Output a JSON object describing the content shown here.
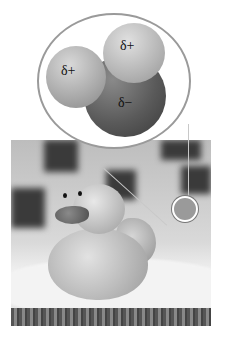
{
  "figure": {
    "top_caption_fragment": "",
    "inset": {
      "type": "water-molecule",
      "atoms": [
        {
          "element": "H",
          "charge_label": "δ+"
        },
        {
          "element": "H",
          "charge_label": "δ+"
        },
        {
          "element": "O",
          "charge_label": "δ−"
        }
      ]
    },
    "photo": {
      "subject": "rubber duck on towel with checkered tile background",
      "magnified_spot": "droplet"
    }
  }
}
